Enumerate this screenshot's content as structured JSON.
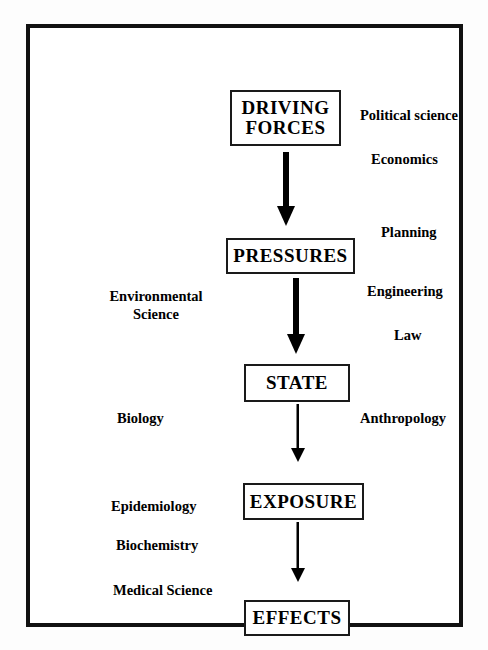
{
  "diagram": {
    "type": "flowchart",
    "orientation": "vertical",
    "colors": {
      "frame": "#111111",
      "box_border": "#1a1a1a",
      "text": "#000000",
      "background": "#ffffff",
      "arrow": "#000000"
    },
    "nodes": [
      {
        "id": "driving_forces",
        "label": "DRIVING\nFORCES",
        "line1": "DRIVING",
        "line2": "FORCES"
      },
      {
        "id": "pressures",
        "label": "PRESSURES"
      },
      {
        "id": "state",
        "label": "STATE"
      },
      {
        "id": "exposure",
        "label": "EXPOSURE"
      },
      {
        "id": "effects",
        "label": "EFFECTS"
      }
    ],
    "edges": [
      {
        "from": "driving_forces",
        "to": "pressures",
        "style": "thick-down-arrow"
      },
      {
        "from": "pressures",
        "to": "state",
        "style": "thick-down-arrow"
      },
      {
        "from": "state",
        "to": "exposure",
        "style": "thin-down-arrow"
      },
      {
        "from": "exposure",
        "to": "effects",
        "style": "thin-down-arrow"
      }
    ],
    "disciplines_right": [
      {
        "id": "political_science",
        "label": "Political science"
      },
      {
        "id": "economics",
        "label": "Economics"
      },
      {
        "id": "planning",
        "label": "Planning"
      },
      {
        "id": "engineering",
        "label": "Engineering"
      },
      {
        "id": "law",
        "label": "Law"
      },
      {
        "id": "anthropology",
        "label": "Anthropology"
      }
    ],
    "disciplines_left": [
      {
        "id": "environmental_science",
        "label": "Environmental Science",
        "line1": "Environmental",
        "line2": "Science"
      },
      {
        "id": "biology",
        "label": "Biology"
      },
      {
        "id": "epidemiology",
        "label": "Epidemiology"
      },
      {
        "id": "biochemistry",
        "label": "Biochemistry"
      },
      {
        "id": "medical_science",
        "label": "Medical Science"
      }
    ]
  }
}
